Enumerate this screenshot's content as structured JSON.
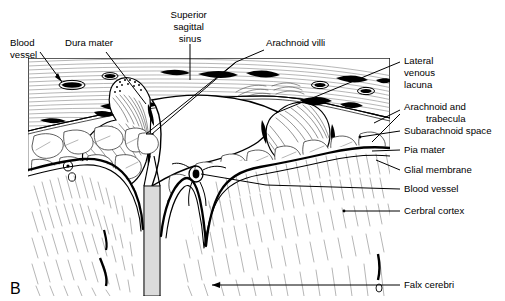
{
  "figure": {
    "panel_label": "B",
    "title_alt": "Coronal section through the meninges, superior sagittal sinus and cerebral cortex",
    "colors": {
      "ink": "#000000",
      "frame": "#b9b9b9",
      "hatch": "#3a3a3a",
      "background": "#ffffff"
    }
  },
  "labels": {
    "blood_vessel_top": {
      "lines": [
        "Blood",
        "vessel"
      ],
      "align": "start",
      "x": 10,
      "y": 46
    },
    "dura_mater": {
      "lines": [
        "Dura mater"
      ],
      "align": "start",
      "x": 65,
      "y": 46
    },
    "superior_sagittal_sinus": {
      "lines": [
        "Superior",
        "sagittal",
        "sinus"
      ],
      "align": "middle",
      "x": 190,
      "y": 18
    },
    "arachnoid_villi": {
      "lines": [
        "Arachnoid villi"
      ],
      "align": "start",
      "x": 266,
      "y": 46
    },
    "lateral_venous_lacuna": {
      "lines": [
        "Lateral",
        "venous",
        "lacuna"
      ],
      "align": "start",
      "x": 404,
      "y": 64
    },
    "arachnoid_and_trabecula": {
      "lines": [
        "Arachnoid and",
        "trabecula"
      ],
      "align": "start",
      "x": 404,
      "y": 110,
      "second_line_indent": 22
    },
    "subarachnoid_space": {
      "lines": [
        "Subarachnoid space"
      ],
      "align": "start",
      "x": 404,
      "y": 134
    },
    "pia_mater": {
      "lines": [
        "Pia mater"
      ],
      "align": "start",
      "x": 404,
      "y": 153
    },
    "glial_membrane": {
      "lines": [
        "Glial membrane"
      ],
      "align": "start",
      "x": 404,
      "y": 173
    },
    "blood_vessel_cortex": {
      "lines": [
        "Blood vessel"
      ],
      "align": "start",
      "x": 404,
      "y": 192
    },
    "cerbral_cortex": {
      "lines": [
        "Cerbral cortex"
      ],
      "align": "start",
      "x": 404,
      "y": 214
    },
    "falx_cerebri": {
      "lines": [
        "Falx cerebri"
      ],
      "align": "start",
      "x": 404,
      "y": 288
    }
  }
}
